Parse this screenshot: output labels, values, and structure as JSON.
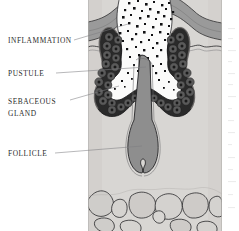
{
  "figure": {
    "type": "anatomical-cross-section",
    "labels": [
      {
        "id": "inflammation",
        "text": "Inflammation",
        "line1": "Inflammation",
        "line2": ""
      },
      {
        "id": "pustule",
        "text": "Pustule",
        "line1": "Pustule",
        "line2": ""
      },
      {
        "id": "sebaceous-gland",
        "text": "Sebaceous gland",
        "line1": "Sebaceous",
        "line2": "gland"
      },
      {
        "id": "follicle",
        "text": "Follicle",
        "line1": "Follicle",
        "line2": ""
      }
    ],
    "structures": [
      {
        "id": "epidermis",
        "name": "Epidermis"
      },
      {
        "id": "dermis",
        "name": "Dermis"
      },
      {
        "id": "pustule-cavity",
        "name": "Pustule cavity with inflammatory infiltrate"
      },
      {
        "id": "sebaceous-gland-left",
        "name": "Sebaceous gland lobe (left)"
      },
      {
        "id": "sebaceous-gland-right",
        "name": "Sebaceous gland lobe (right)"
      },
      {
        "id": "hair-follicle",
        "name": "Hair follicle shaft and bulb"
      },
      {
        "id": "subcutaneous-fat",
        "name": "Subcutaneous fat lobules"
      }
    ],
    "colors": {
      "page_background": "#ffffff",
      "dermis": "#d8d6d3",
      "epidermis": "#9a9a9a",
      "gland_dark": "#2a2a2a",
      "gland_cell": "#4a4a4a",
      "follicle": "#8e8e8e",
      "cavity": "#fbfbfa",
      "outline": "#1e1e20",
      "leader_line": "#7d7d80",
      "label_text": "#2b2b2b"
    }
  }
}
